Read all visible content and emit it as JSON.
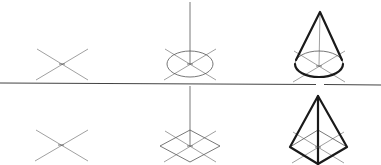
{
  "diagram": {
    "title": "",
    "divider": {
      "x1": 0,
      "y1": 83,
      "x2": 381,
      "y2": 85,
      "gap_x": [
        316,
        324
      ]
    },
    "rows": [
      {
        "name": "cone-row",
        "steps": [
          {
            "name": "step-1-cross",
            "center": [
              62,
              64
            ],
            "cross": [
              [
                37,
                49,
                88,
                80
              ],
              [
                88,
                49,
                36,
                80
              ]
            ]
          },
          {
            "name": "step-2-ellipse-axis",
            "center": [
              190,
              64
            ],
            "cross": [
              [
                165,
                49,
                216,
                80
              ],
              [
                216,
                49,
                164,
                80
              ]
            ],
            "ellipse": {
              "rx": 23,
              "ry": 13
            },
            "axis_top": 2
          },
          {
            "name": "step-3-cone",
            "center": [
              319,
              66
            ],
            "cross": [
              [
                294,
                51,
                345,
                82
              ],
              [
                345,
                51,
                293,
                82
              ]
            ],
            "ellipse": {
              "rx": 24,
              "ry": 13
            },
            "apex": [
              320,
              12
            ]
          }
        ]
      },
      {
        "name": "pyramid-row",
        "steps": [
          {
            "name": "step-1-cross",
            "center": [
              61,
              145
            ],
            "cross": [
              [
                36,
                130,
                88,
                161
              ],
              [
                88,
                130,
                35,
                161
              ]
            ]
          },
          {
            "name": "step-2-diamond-axis",
            "center": [
              190,
              146
            ],
            "cross": [
              [
                165,
                131,
                216,
                162
              ],
              [
                216,
                131,
                164,
                162
              ]
            ],
            "diamond": [
              [
                190,
                130
              ],
              [
                220,
                146
              ],
              [
                190,
                162
              ],
              [
                160,
                146
              ]
            ],
            "axis_top": 86
          },
          {
            "name": "step-3-pyramid",
            "center": [
              318,
              147
            ],
            "cross": [
              [
                293,
                132,
                344,
                163
              ],
              [
                344,
                132,
                292,
                163
              ]
            ],
            "diamond": [
              [
                318,
                130
              ],
              [
                347,
                147
              ],
              [
                318,
                164
              ],
              [
                290,
                147
              ]
            ],
            "apex": [
              318,
              96
            ]
          }
        ]
      }
    ],
    "colors": {
      "background": "#ffffff",
      "ink": "#1a1a1a",
      "guide": "#777777"
    }
  }
}
